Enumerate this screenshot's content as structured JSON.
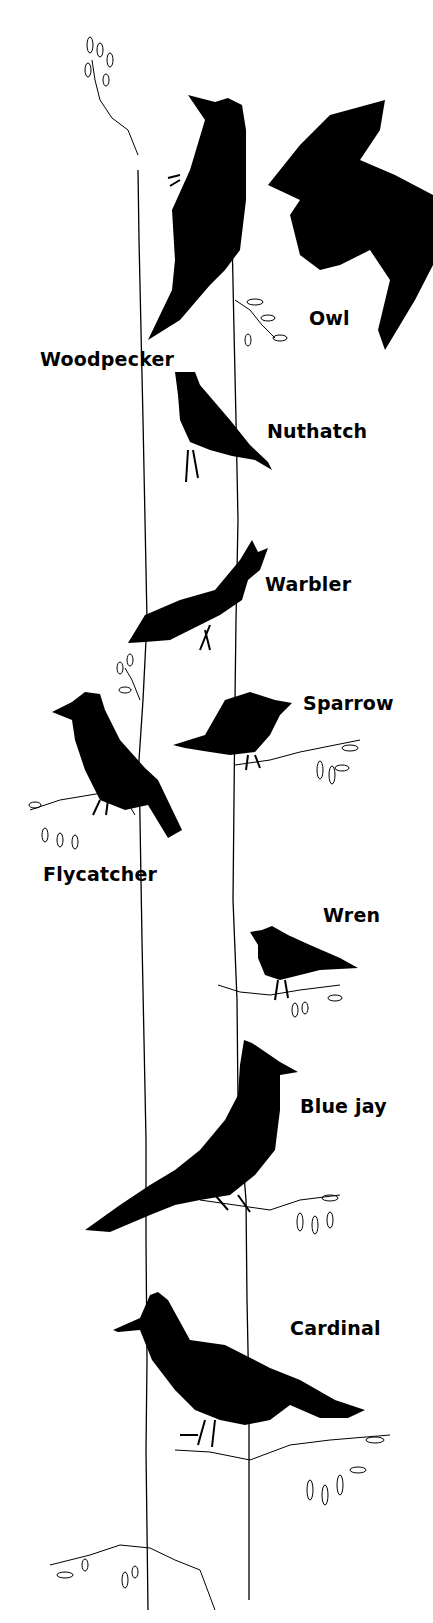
{
  "illustration": {
    "colors": {
      "silhouette": "#000000",
      "background": "#ffffff",
      "line": "#000000"
    },
    "birds": [
      {
        "name": "Woodpecker",
        "label_x": 40,
        "label_y": 348
      },
      {
        "name": "Owl",
        "label_x": 309,
        "label_y": 307
      },
      {
        "name": "Nuthatch",
        "label_x": 267,
        "label_y": 420
      },
      {
        "name": "Warbler",
        "label_x": 265,
        "label_y": 573
      },
      {
        "name": "Sparrow",
        "label_x": 303,
        "label_y": 692
      },
      {
        "name": "Flycatcher",
        "label_x": 43,
        "label_y": 863
      },
      {
        "name": "Wren",
        "label_x": 323,
        "label_y": 904
      },
      {
        "name": "Blue jay",
        "label_x": 300,
        "label_y": 1095
      },
      {
        "name": "Cardinal",
        "label_x": 290,
        "label_y": 1317
      }
    ]
  }
}
